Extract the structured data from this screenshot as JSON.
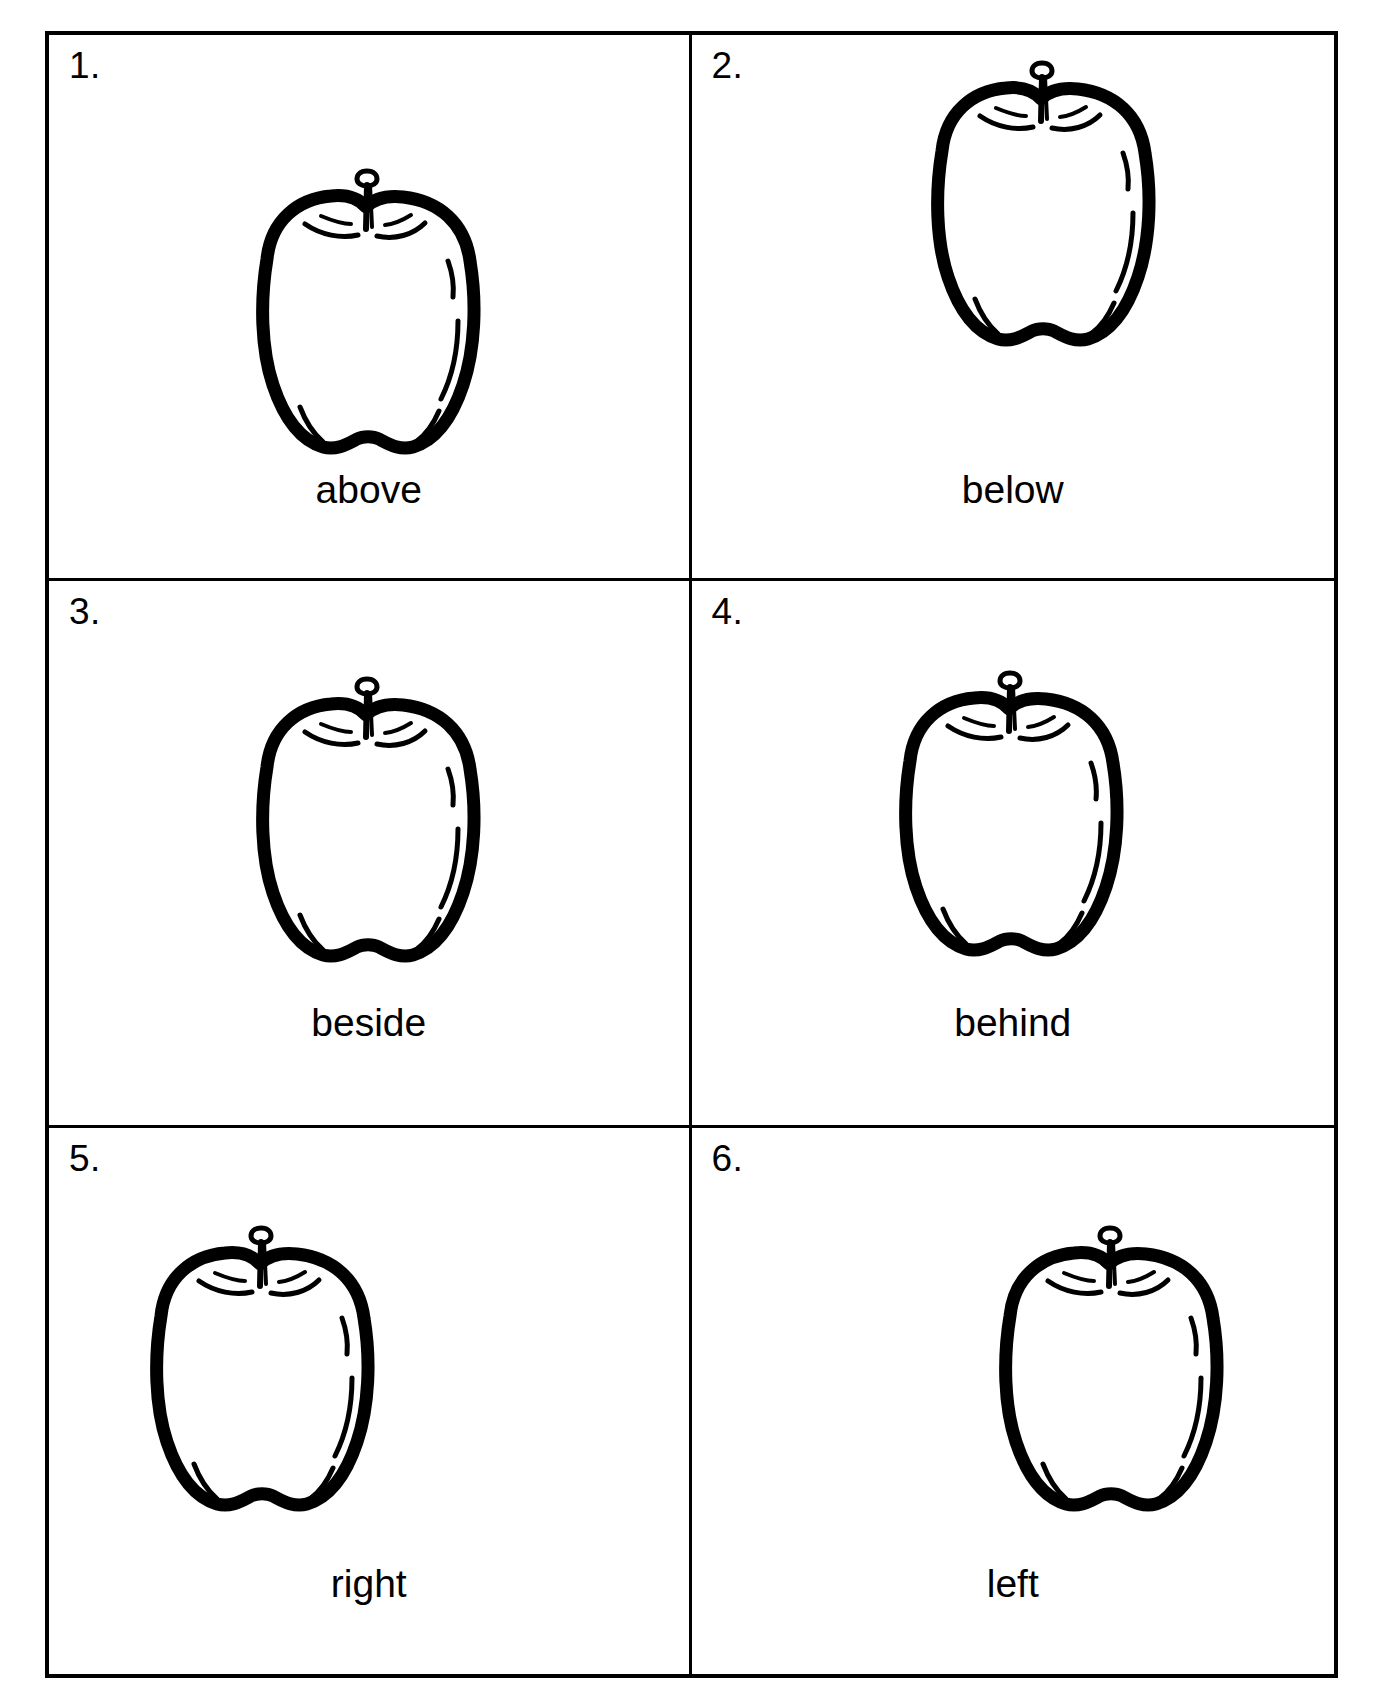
{
  "worksheet": {
    "title": "Apple position words worksheet",
    "layout": {
      "columns": 2,
      "rows": 3
    },
    "border_color": "#000000",
    "background_color": "#ffffff",
    "ink_color": "#000000"
  },
  "cells": [
    {
      "number": "1.",
      "label": "above",
      "icon": "apple-icon",
      "apple_position": "center-low"
    },
    {
      "number": "2.",
      "label": "below",
      "icon": "apple-icon",
      "apple_position": "center-high"
    },
    {
      "number": "3.",
      "label": "beside",
      "icon": "apple-icon",
      "apple_position": "center"
    },
    {
      "number": "4.",
      "label": "behind",
      "icon": "apple-icon",
      "apple_position": "center"
    },
    {
      "number": "5.",
      "label": "right",
      "icon": "apple-icon",
      "apple_position": "left"
    },
    {
      "number": "6.",
      "label": "left",
      "icon": "apple-icon",
      "apple_position": "right"
    }
  ]
}
